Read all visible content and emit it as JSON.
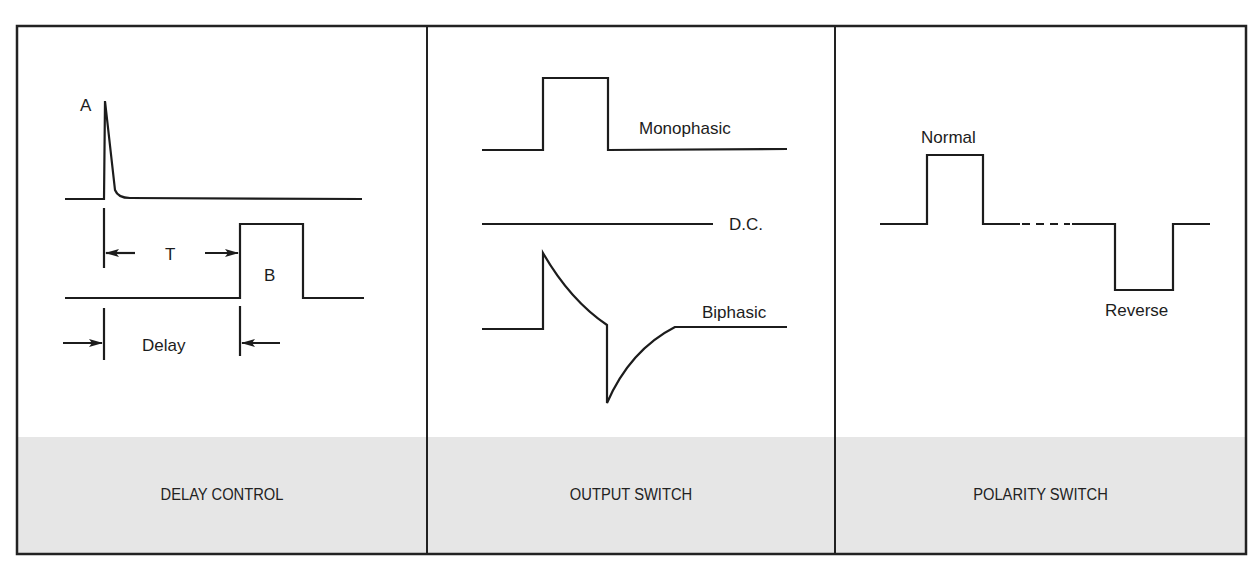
{
  "colors": {
    "ink": "#1c1c1c",
    "paper": "#ffffff",
    "footer_band": "#e6e6e6",
    "frame": "#222222"
  },
  "panels": [
    {
      "id": "delay",
      "caption": "DELAY CONTROL",
      "labels": {
        "pulse_a": "A",
        "pulse_b": "B",
        "interval": "T",
        "delay": "Delay"
      }
    },
    {
      "id": "output",
      "caption": "OUTPUT SWITCH",
      "labels": {
        "monophasic": "Monophasic",
        "dc": "D.C.",
        "biphasic": "Biphasic"
      }
    },
    {
      "id": "polarity",
      "caption": "POLARITY SWITCH",
      "labels": {
        "normal": "Normal",
        "reverse": "Reverse"
      }
    }
  ]
}
